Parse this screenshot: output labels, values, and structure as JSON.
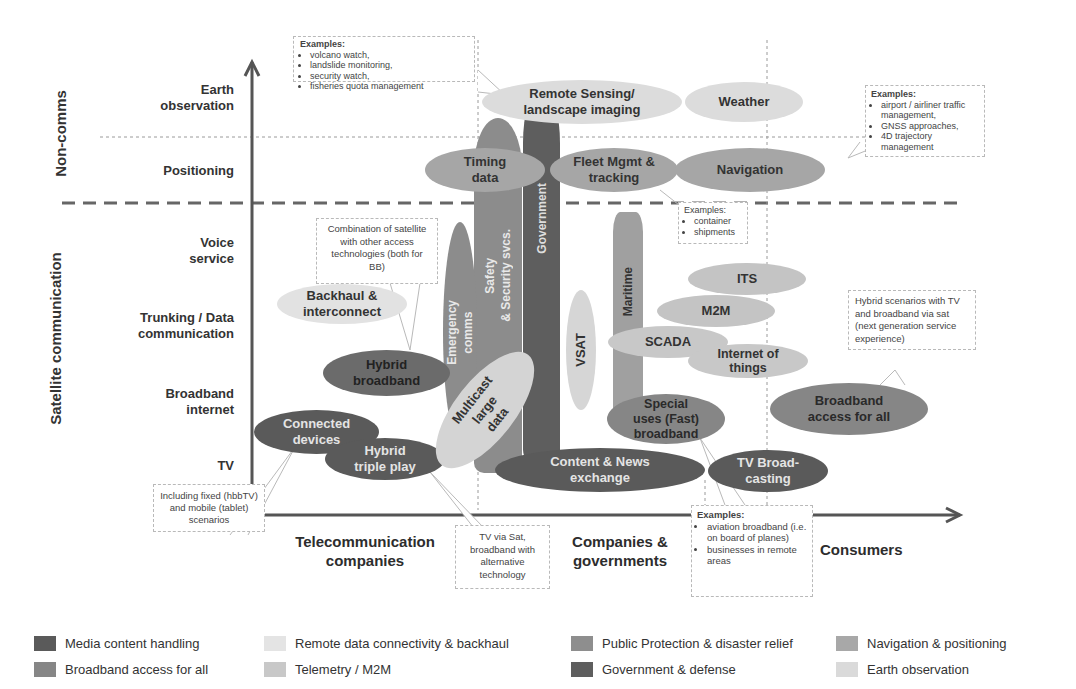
{
  "diagram": {
    "sections": {
      "non_comms": "Non-comms",
      "satellite_communication": "Satellite communication"
    },
    "y_axis_labels": [
      {
        "id": "earth-observation",
        "text": "Earth\nobservation"
      },
      {
        "id": "positioning",
        "text": "Positioning"
      },
      {
        "id": "voice-service",
        "text": "Voice\nservice"
      },
      {
        "id": "trunking",
        "text": "Trunking / Data\ncommunication"
      },
      {
        "id": "broadband-internet",
        "text": "Broadband\ninternet"
      },
      {
        "id": "tv",
        "text": "TV"
      }
    ],
    "x_axis_labels": [
      {
        "id": "telecom",
        "text": "Telecommunication\ncompanies"
      },
      {
        "id": "companies-governments",
        "text": "Companies &\ngovernments"
      },
      {
        "id": "consumers",
        "text": "Consumers"
      }
    ],
    "bubbles": {
      "remote_sensing": "Remote Sensing/\nlandscape imaging",
      "weather": "Weather",
      "timing": "Timing\ndata",
      "fleet": "Fleet Mgmt &\ntracking",
      "navigation": "Navigation",
      "government": "Government",
      "safety": "Safety\n& Security svcs.",
      "emergency": "Emergency\ncomms",
      "maritime": "Maritime",
      "backhaul": "Backhaul &\ninterconnect",
      "hybrid_broadband": "Hybrid\nbroadband",
      "vsat": "VSAT",
      "its": "ITS",
      "m2m": "M2M",
      "scada": "SCADA",
      "iot": "Internet of\nthings",
      "special_uses": "Special\nuses (Fast)\nbroadband",
      "broadband_all": "Broadband\naccess for all",
      "connected_devices": "Connected\ndevices",
      "hybrid_triple": "Hybrid\ntriple play",
      "multicast": "Multicast\nlarge data",
      "content_news": "Content & News\nexchange",
      "tv_broadcasting": "TV Broad-\ncasting"
    },
    "callouts": {
      "earth_obs": {
        "header": "Examples:",
        "items": [
          "volcano watch,",
          "landslide monitoring,",
          "security watch,",
          "fisheries quota management"
        ]
      },
      "navigation": {
        "header": "Examples:",
        "items": [
          "airport / airliner traffic management,",
          "GNSS approaches,",
          "4D trajectory management"
        ]
      },
      "fleet": {
        "header": "Examples:",
        "items": [
          "container",
          "shipments"
        ]
      },
      "combination": {
        "text": "Combination of satellite with other access technologies (both for BB)"
      },
      "hybrid_scenarios": {
        "text": "Hybrid scenarios with TV and broadband via sat (next generation service experience)"
      },
      "including_fixed": {
        "text": "Including fixed (hbbTV) and mobile (tablet) scenarios"
      },
      "tv_via_sat": {
        "text": "TV via Sat, broadband with alternative technology"
      },
      "aviation": {
        "header": "Examples:",
        "items": [
          "aviation broadband (i.e. on board of planes)",
          "businesses in remote areas"
        ]
      }
    }
  },
  "legend": [
    {
      "label": "Media content handling",
      "color": "#5a5a5a"
    },
    {
      "label": "Broadband access for all",
      "color": "#868686"
    },
    {
      "label": "Remote data connectivity & backhaul",
      "color": "#e4e4e4"
    },
    {
      "label": "Telemetry / M2M",
      "color": "#c8c8c8"
    },
    {
      "label": "Public Protection & disaster relief",
      "color": "#8e8e8e"
    },
    {
      "label": "Government & defense",
      "color": "#5e5e5e"
    },
    {
      "label": "Navigation & positioning",
      "color": "#a8a8a8"
    },
    {
      "label": "Earth observation",
      "color": "#dadada"
    }
  ],
  "colors": {
    "media": "#5a5a5a",
    "broadband": "#868686",
    "remote": "#e2e2e2",
    "telemetry": "#c4c4c4",
    "ppdr": "#8c8c8c",
    "government": "#5e5e5e",
    "navigation": "#a6a6a6",
    "earth": "#d8d8d8"
  }
}
